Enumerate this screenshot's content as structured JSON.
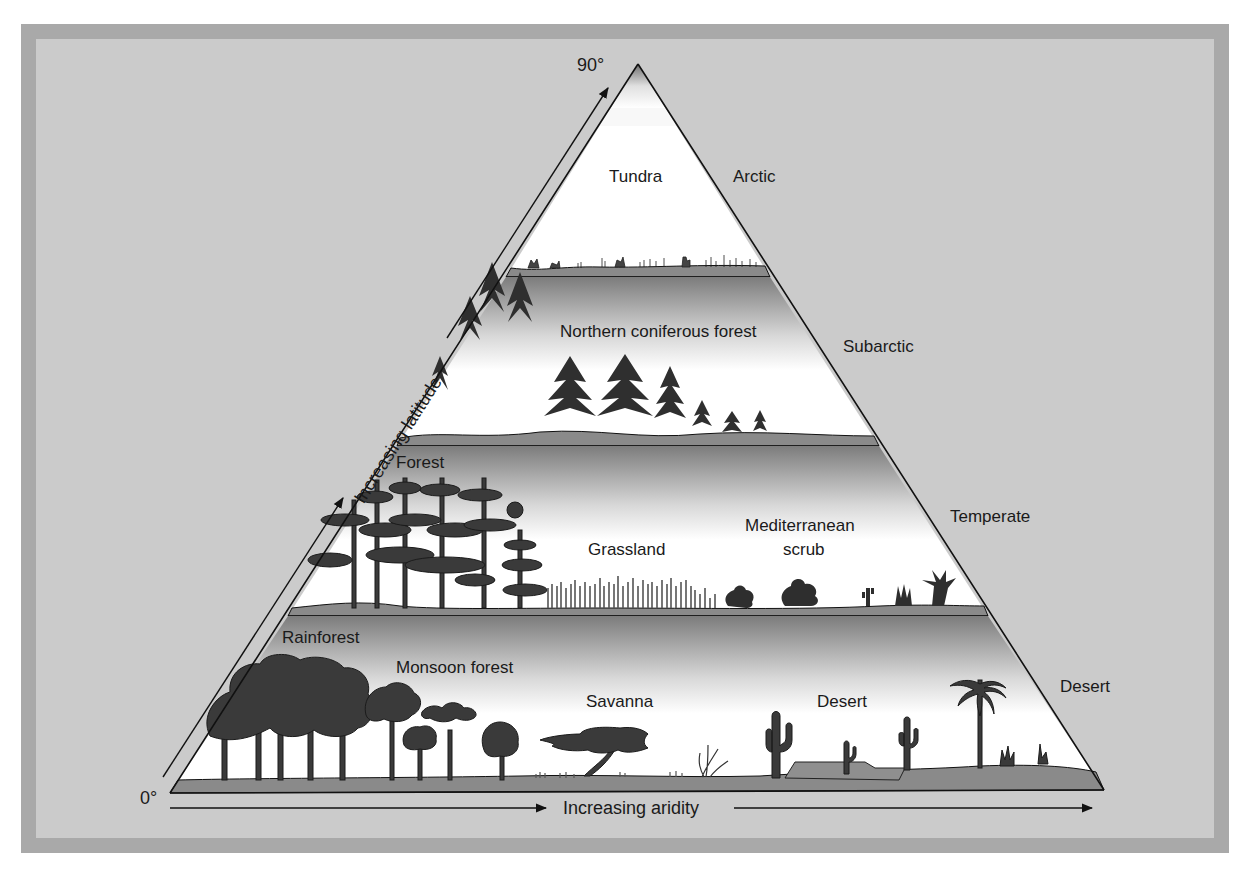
{
  "axes": {
    "latitude_top": "90°",
    "latitude_bottom": "0°",
    "latitude_label": "Increasing latitude",
    "aridity_label": "Increasing aridity"
  },
  "zones": [
    {
      "name": "Arctic"
    },
    {
      "name": "Subarctic"
    },
    {
      "name": "Temperate"
    },
    {
      "name": "Desert"
    }
  ],
  "bands": [
    {
      "zone": "Arctic",
      "biomes": [
        "Tundra"
      ]
    },
    {
      "zone": "Subarctic",
      "biomes": [
        "Northern coniferous forest"
      ]
    },
    {
      "zone": "Temperate",
      "biomes": [
        "Forest",
        "Grassland",
        "Mediterranean",
        "scrub"
      ]
    },
    {
      "zone": "Desert",
      "biomes": [
        "Rainforest",
        "Monsoon forest",
        "Savanna",
        "Desert"
      ]
    }
  ],
  "colors": {
    "frame_outer": "#a9a9a9",
    "frame_inner": "#cbcbcb",
    "ground": "#8a8a8a",
    "vegetation": "#3a3a3a",
    "line": "#111111"
  }
}
